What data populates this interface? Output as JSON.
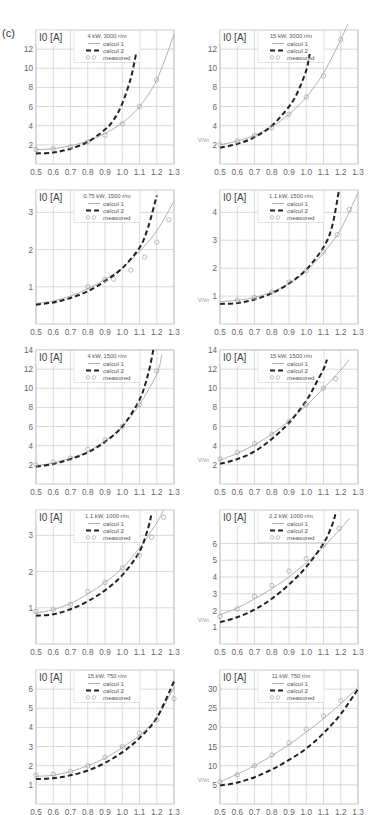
{
  "figure": {
    "label": "(c)"
  },
  "chart_data": [
    {
      "type": "line",
      "title": "4 kW, 3000 r/m",
      "xlabel": "V/Vn",
      "ylabel": "I0 [A]",
      "xlim": [
        0.5,
        1.3
      ],
      "ylim": [
        0,
        14
      ],
      "x_ticks": [
        0.5,
        0.6,
        0.7,
        0.8,
        0.9,
        1.0,
        1.1,
        1.2,
        1.3
      ],
      "y_ticks": [
        2,
        4,
        6,
        8,
        10,
        12
      ],
      "grid": true,
      "legend": [
        "calcul 1",
        "calcul 2",
        "measured"
      ],
      "series": [
        {
          "name": "calcul 1",
          "x": [
            0.5,
            0.6,
            0.7,
            0.8,
            0.9,
            1.0,
            1.1,
            1.2,
            1.3
          ],
          "y": [
            1.5,
            1.6,
            1.9,
            2.4,
            3.2,
            4.3,
            6.0,
            8.8,
            13.5
          ]
        },
        {
          "name": "calcul 2",
          "x": [
            0.5,
            0.6,
            0.7,
            0.8,
            0.9,
            0.95,
            1.0,
            1.05,
            1.08
          ],
          "y": [
            1.1,
            1.2,
            1.6,
            2.3,
            3.6,
            4.6,
            6.3,
            9.0,
            11.5
          ]
        },
        {
          "name": "measured",
          "x": [
            0.5,
            0.6,
            0.7,
            0.8,
            0.9,
            1.0,
            1.1,
            1.2
          ],
          "y": [
            1.5,
            1.6,
            1.8,
            2.3,
            3.0,
            4.2,
            6.0,
            8.8
          ]
        }
      ]
    },
    {
      "type": "line",
      "title": "15 kW, 3000 r/m",
      "xlabel": "V/Vn",
      "ylabel": "I0 [A]",
      "xlim": [
        0.5,
        1.3
      ],
      "ylim": [
        0,
        14
      ],
      "x_ticks": [
        0.5,
        0.6,
        0.7,
        0.8,
        0.9,
        1.0,
        1.1,
        1.2,
        1.3
      ],
      "y_ticks": [
        2,
        4,
        6,
        8,
        10,
        12
      ],
      "grid": true,
      "legend": [
        "calcul 1",
        "calcul 2",
        "measured"
      ],
      "series": [
        {
          "name": "calcul 1",
          "x": [
            0.5,
            0.6,
            0.7,
            0.8,
            0.9,
            1.0,
            1.1,
            1.2,
            1.25
          ],
          "y": [
            2.0,
            2.4,
            3.0,
            3.9,
            5.2,
            7.0,
            9.5,
            13.0,
            15.0
          ]
        },
        {
          "name": "calcul 2",
          "x": [
            0.5,
            0.6,
            0.7,
            0.8,
            0.9,
            0.95,
            1.0,
            1.02
          ],
          "y": [
            1.7,
            2.1,
            2.8,
            4.0,
            6.0,
            7.5,
            9.8,
            11.5
          ]
        },
        {
          "name": "measured",
          "x": [
            0.5,
            0.6,
            0.7,
            0.8,
            0.9,
            1.0,
            1.1,
            1.2
          ],
          "y": [
            2.0,
            2.4,
            3.0,
            3.8,
            5.2,
            7.0,
            9.2,
            13.0
          ]
        }
      ]
    },
    {
      "type": "line",
      "title": "0.75 kW, 1500 r/m",
      "xlabel": "V/Vn",
      "ylabel": "I0 [A]",
      "xlim": [
        0.5,
        1.3
      ],
      "ylim": [
        0,
        3.6
      ],
      "x_ticks": [
        0.5,
        0.6,
        0.7,
        0.8,
        0.9,
        1.0,
        1.1,
        1.2,
        1.3
      ],
      "y_ticks": [
        1,
        2,
        3
      ],
      "grid": true,
      "legend": [
        "calcul 1",
        "calcul 2",
        "measured"
      ],
      "series": [
        {
          "name": "calcul 1",
          "x": [
            0.5,
            0.6,
            0.7,
            0.8,
            0.9,
            1.0,
            1.1,
            1.2,
            1.3
          ],
          "y": [
            0.55,
            0.62,
            0.75,
            0.95,
            1.2,
            1.5,
            1.95,
            2.5,
            3.3
          ]
        },
        {
          "name": "calcul 2",
          "x": [
            0.5,
            0.6,
            0.7,
            0.8,
            0.9,
            1.0,
            1.1,
            1.15,
            1.2
          ],
          "y": [
            0.52,
            0.58,
            0.7,
            0.88,
            1.15,
            1.5,
            2.05,
            2.6,
            3.45
          ]
        },
        {
          "name": "measured",
          "x": [
            0.8,
            0.9,
            0.95,
            1.05,
            1.13,
            1.2,
            1.27
          ],
          "y": [
            1.0,
            1.2,
            1.2,
            1.45,
            1.8,
            2.2,
            2.8
          ]
        }
      ]
    },
    {
      "type": "line",
      "title": "1.1 kW, 1500 r/m",
      "xlabel": "V/Vn",
      "ylabel": "I0 [A]",
      "xlim": [
        0.5,
        1.3
      ],
      "ylim": [
        0,
        4.8
      ],
      "x_ticks": [
        0.5,
        0.6,
        0.7,
        0.8,
        0.9,
        1.0,
        1.1,
        1.2,
        1.3
      ],
      "y_ticks": [
        1,
        2,
        3,
        4
      ],
      "grid": true,
      "legend": [
        "calcul 1",
        "calcul 2",
        "measured"
      ],
      "series": [
        {
          "name": "calcul 1",
          "x": [
            0.5,
            0.6,
            0.7,
            0.8,
            0.9,
            1.0,
            1.1,
            1.2,
            1.3
          ],
          "y": [
            0.8,
            0.85,
            0.95,
            1.15,
            1.45,
            1.9,
            2.55,
            3.4,
            4.7
          ]
        },
        {
          "name": "calcul 2",
          "x": [
            0.5,
            0.6,
            0.7,
            0.8,
            0.9,
            1.0,
            1.1,
            1.15,
            1.19
          ],
          "y": [
            0.72,
            0.75,
            0.88,
            1.1,
            1.45,
            1.95,
            2.75,
            3.5,
            4.8
          ]
        },
        {
          "name": "measured",
          "x": [
            0.6,
            0.7,
            0.8,
            0.9,
            1.0,
            1.1,
            1.18,
            1.25
          ],
          "y": [
            0.85,
            0.95,
            1.15,
            1.5,
            1.9,
            2.6,
            3.2,
            4.1
          ]
        }
      ]
    },
    {
      "type": "line",
      "title": "4 kW, 1500 r/m",
      "xlabel": "V/Vn",
      "ylabel": "I0 [A]",
      "xlim": [
        0.5,
        1.3
      ],
      "ylim": [
        0,
        14
      ],
      "x_ticks": [
        0.5,
        0.6,
        0.7,
        0.8,
        0.9,
        1.0,
        1.1,
        1.2,
        1.3
      ],
      "y_ticks": [
        2,
        4,
        6,
        8,
        10,
        12,
        14
      ],
      "grid": true,
      "legend": [
        "calcul 1",
        "calcul 2",
        "measured"
      ],
      "series": [
        {
          "name": "calcul 1",
          "x": [
            0.5,
            0.6,
            0.7,
            0.8,
            0.9,
            1.0,
            1.1,
            1.2,
            1.23
          ],
          "y": [
            1.9,
            2.2,
            2.7,
            3.4,
            4.5,
            6.0,
            8.3,
            11.5,
            13.5
          ]
        },
        {
          "name": "calcul 2",
          "x": [
            0.5,
            0.6,
            0.7,
            0.8,
            0.9,
            1.0,
            1.1,
            1.15,
            1.18
          ],
          "y": [
            1.8,
            2.1,
            2.6,
            3.3,
            4.4,
            6.0,
            8.8,
            11.5,
            14.0
          ]
        },
        {
          "name": "measured",
          "x": [
            0.5,
            0.6,
            0.7,
            0.8,
            0.9,
            1.0,
            1.1,
            1.2
          ],
          "y": [
            2.0,
            2.3,
            2.7,
            3.6,
            4.6,
            6.0,
            8.3,
            11.8
          ]
        }
      ]
    },
    {
      "type": "line",
      "title": "15 kW, 1500 r/m",
      "xlabel": "V/Vn",
      "ylabel": "I0 [A]",
      "xlim": [
        0.5,
        1.3
      ],
      "ylim": [
        0,
        14
      ],
      "x_ticks": [
        0.5,
        0.6,
        0.7,
        0.8,
        0.9,
        1.0,
        1.1,
        1.2,
        1.3
      ],
      "y_ticks": [
        2,
        4,
        6,
        8,
        10,
        12,
        14
      ],
      "grid": true,
      "legend": [
        "calcul 1",
        "calcul 2",
        "measured"
      ],
      "series": [
        {
          "name": "calcul 1",
          "x": [
            0.5,
            0.6,
            0.7,
            0.8,
            0.9,
            1.0,
            1.1,
            1.2,
            1.25
          ],
          "y": [
            2.5,
            3.2,
            4.1,
            5.2,
            6.6,
            8.2,
            10.0,
            11.9,
            13.0
          ]
        },
        {
          "name": "calcul 2",
          "x": [
            0.5,
            0.6,
            0.7,
            0.8,
            0.9,
            1.0,
            1.05,
            1.1,
            1.12
          ],
          "y": [
            2.1,
            2.6,
            3.4,
            4.7,
            6.4,
            8.7,
            10.3,
            12.0,
            13.0
          ]
        },
        {
          "name": "measured",
          "x": [
            0.5,
            0.6,
            0.7,
            0.8,
            0.9,
            1.0,
            1.1,
            1.17
          ],
          "y": [
            2.6,
            3.3,
            4.2,
            5.2,
            6.5,
            8.3,
            10.0,
            11.0
          ]
        }
      ]
    },
    {
      "type": "line",
      "title": "1.1 kW, 1000 r/m",
      "xlabel": "V/Vn",
      "ylabel": "I0 [A]",
      "xlim": [
        0.5,
        1.3
      ],
      "ylim": [
        0,
        3.7
      ],
      "x_ticks": [
        0.5,
        0.6,
        0.7,
        0.8,
        0.9,
        1.0,
        1.1,
        1.2,
        1.3
      ],
      "y_ticks": [
        1,
        2,
        3
      ],
      "grid": true,
      "legend": [
        "calcul 1",
        "calcul 2",
        "measured"
      ],
      "series": [
        {
          "name": "calcul 1",
          "x": [
            0.5,
            0.6,
            0.7,
            0.8,
            0.9,
            1.0,
            1.1,
            1.2,
            1.24
          ],
          "y": [
            0.85,
            0.95,
            1.12,
            1.38,
            1.7,
            2.1,
            2.65,
            3.35,
            3.7
          ]
        },
        {
          "name": "calcul 2",
          "x": [
            0.5,
            0.6,
            0.7,
            0.8,
            0.9,
            1.0,
            1.1,
            1.15,
            1.17
          ],
          "y": [
            0.78,
            0.82,
            0.96,
            1.18,
            1.48,
            1.9,
            2.55,
            3.2,
            3.6
          ]
        },
        {
          "name": "measured",
          "x": [
            0.5,
            0.6,
            0.7,
            0.8,
            0.9,
            1.0,
            1.1,
            1.17,
            1.24
          ],
          "y": [
            0.9,
            0.95,
            1.1,
            1.45,
            1.7,
            2.1,
            2.45,
            2.95,
            3.5
          ]
        }
      ]
    },
    {
      "type": "line",
      "title": "2.2 kW, 1000 r/m",
      "xlabel": "V/Vn",
      "ylabel": "I0 [A]",
      "xlim": [
        0.5,
        1.3
      ],
      "ylim": [
        0,
        8
      ],
      "x_ticks": [
        0.5,
        0.6,
        0.7,
        0.8,
        0.9,
        1.0,
        1.1,
        1.2,
        1.3
      ],
      "y_ticks": [
        1,
        2,
        3,
        4,
        5,
        6
      ],
      "grid": true,
      "legend": [
        "calcul 1",
        "calcul 2",
        "measured"
      ],
      "series": [
        {
          "name": "calcul 1",
          "x": [
            0.5,
            0.6,
            0.7,
            0.8,
            0.9,
            1.0,
            1.1,
            1.2,
            1.25
          ],
          "y": [
            1.75,
            2.15,
            2.7,
            3.3,
            4.0,
            4.85,
            5.8,
            6.9,
            7.5
          ]
        },
        {
          "name": "calcul 2",
          "x": [
            0.5,
            0.6,
            0.7,
            0.8,
            0.9,
            1.0,
            1.1,
            1.15,
            1.17
          ],
          "y": [
            1.3,
            1.6,
            2.05,
            2.7,
            3.55,
            4.6,
            6.0,
            7.1,
            7.8
          ]
        },
        {
          "name": "measured",
          "x": [
            0.5,
            0.6,
            0.7,
            0.8,
            0.9,
            1.0,
            1.1,
            1.19
          ],
          "y": [
            1.65,
            2.1,
            2.85,
            3.5,
            4.35,
            5.1,
            5.9,
            6.9
          ]
        }
      ]
    },
    {
      "type": "line",
      "title": "15 kW, 750 r/m",
      "xlabel": "V/Vn",
      "ylabel": "I0 [A]",
      "xlim": [
        0.5,
        1.3
      ],
      "ylim": [
        0,
        7
      ],
      "x_ticks": [
        0.5,
        0.6,
        0.7,
        0.8,
        0.9,
        1.0,
        1.1,
        1.2,
        1.3
      ],
      "y_ticks": [
        1,
        2,
        3,
        4,
        5,
        6
      ],
      "grid": true,
      "legend": [
        "calcul 1",
        "calcul 2",
        "measured"
      ],
      "series": [
        {
          "name": "calcul 1",
          "x": [
            0.5,
            0.6,
            0.7,
            0.8,
            0.9,
            1.0,
            1.1,
            1.2,
            1.3
          ],
          "y": [
            1.45,
            1.5,
            1.7,
            2.0,
            2.4,
            2.95,
            3.6,
            4.5,
            6.1
          ]
        },
        {
          "name": "calcul 2",
          "x": [
            0.5,
            0.6,
            0.7,
            0.8,
            0.9,
            1.0,
            1.1,
            1.2,
            1.3
          ],
          "y": [
            1.3,
            1.35,
            1.5,
            1.75,
            2.15,
            2.7,
            3.45,
            4.5,
            6.4
          ]
        },
        {
          "name": "measured",
          "x": [
            0.5,
            0.6,
            0.7,
            0.8,
            0.9,
            1.0,
            1.1,
            1.2,
            1.3
          ],
          "y": [
            1.5,
            1.55,
            1.7,
            2.0,
            2.45,
            3.0,
            3.7,
            4.4,
            5.5
          ]
        }
      ]
    },
    {
      "type": "line",
      "title": "11 kW, 750 r/m",
      "xlabel": "V/Vn",
      "ylabel": "I0 [A]",
      "xlim": [
        0.5,
        1.3
      ],
      "ylim": [
        0,
        35
      ],
      "x_ticks": [
        0.5,
        0.6,
        0.7,
        0.8,
        0.9,
        1.0,
        1.1,
        1.2,
        1.3
      ],
      "y_ticks": [
        5,
        10,
        15,
        20,
        25,
        30
      ],
      "grid": true,
      "legend": [
        "calcul 1",
        "calcul 2",
        "measured"
      ],
      "series": [
        {
          "name": "calcul 1",
          "x": [
            0.5,
            0.6,
            0.7,
            0.8,
            0.9,
            1.0,
            1.1,
            1.2,
            1.3
          ],
          "y": [
            5.8,
            7.8,
            10.0,
            12.6,
            15.5,
            18.8,
            22.3,
            26.2,
            30.5
          ]
        },
        {
          "name": "calcul 2",
          "x": [
            0.5,
            0.6,
            0.7,
            0.8,
            0.9,
            1.0,
            1.1,
            1.2,
            1.3
          ],
          "y": [
            4.8,
            5.6,
            7.0,
            9.0,
            11.5,
            14.5,
            18.5,
            23.5,
            30.0
          ]
        },
        {
          "name": "measured",
          "x": [
            0.5,
            0.6,
            0.7,
            0.8,
            0.9,
            1.0,
            1.1,
            1.2
          ],
          "y": [
            5.8,
            7.6,
            10.0,
            12.8,
            16.0,
            19.5,
            23.0,
            27.0
          ]
        }
      ]
    }
  ],
  "panels": [
    {
      "title": "4 kW, 3000 r/m",
      "ylabel": "I0 [A]"
    },
    {
      "title": "15 kW, 3000 r/m",
      "ylabel": "I0 [A]"
    },
    {
      "title": "0.75 kW, 1500 r/m",
      "ylabel": "I0 [A]"
    },
    {
      "title": "1.1 kW, 1500 r/m",
      "ylabel": "I0 [A]"
    },
    {
      "title": "4 kW, 1500 r/m",
      "ylabel": "I0 [A]"
    },
    {
      "title": "15 kW, 1500 r/m",
      "ylabel": "I0 [A]"
    },
    {
      "title": "1.1 kW, 1000 r/m",
      "ylabel": "I0 [A]"
    },
    {
      "title": "2.2 kW, 1000 r/m",
      "ylabel": "I0 [A]"
    },
    {
      "title": "15 kW, 750 r/m",
      "ylabel": "I0 [A]"
    },
    {
      "title": "11 kW, 750 r/m",
      "ylabel": "I0 [A]"
    }
  ],
  "legend": {
    "calcul1": "calcul 1",
    "calcul2": "calcul 2",
    "measured": "measured"
  },
  "axis": {
    "xlabel_short": "V/Vn"
  }
}
